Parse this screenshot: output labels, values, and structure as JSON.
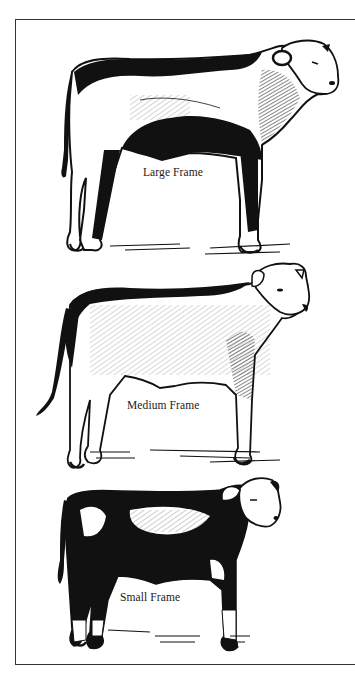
{
  "figure": {
    "panels": [
      {
        "id": "large",
        "label": "Large Frame"
      },
      {
        "id": "medium",
        "label": "Medium Frame"
      },
      {
        "id": "small",
        "label": "Small Frame"
      }
    ]
  },
  "colors": {
    "ink": "#111111",
    "paper": "#ffffff",
    "border": "#333333"
  }
}
